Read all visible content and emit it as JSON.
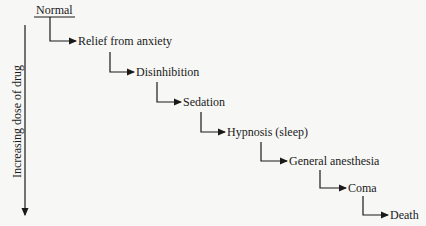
{
  "diagram": {
    "start": "Normal",
    "axis_label": "Increasing dose of drug",
    "stages": [
      "Relief from anxiety",
      "Disinhibition",
      "Sedation",
      "Hypnosis (sleep)",
      "General anesthesia",
      "Coma",
      "Death"
    ]
  }
}
